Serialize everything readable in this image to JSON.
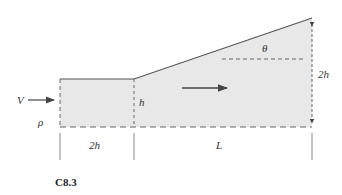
{
  "figure": {
    "caption": "C8.3",
    "colors": {
      "fill": "#e8e8e8",
      "outline": "#555555",
      "dash": "#666666",
      "text": "#333333"
    }
  },
  "labels": {
    "inlet_velocity": "V",
    "density": "ρ",
    "inlet_height": "h",
    "inlet_length": "2h",
    "diffuser_length": "L",
    "outlet_height": "2h",
    "angle": "θ"
  }
}
